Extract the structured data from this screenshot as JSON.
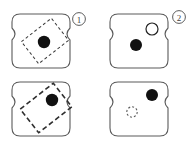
{
  "figure": {
    "title": "",
    "background_color": "#ffffff",
    "outline_color": "#555555",
    "filled_marker_color": "#111111",
    "hollow_marker_color": "#ffffff",
    "dashed_color": "#3a3a3a",
    "label_color": "#3f3f3f",
    "panel_count": 4,
    "group_count": 2
  },
  "groups": [
    {
      "id": "group-1",
      "label": "①",
      "number": "1"
    },
    {
      "id": "group-2",
      "label": "②",
      "number": "2"
    }
  ],
  "panels": [
    {
      "id": "panel-top-left",
      "position": "top-left",
      "group": "1",
      "shape": "spool-rounded-square",
      "markers": [
        {
          "kind": "filled-circle",
          "x": 44,
          "y": 42,
          "r": 6.2
        }
      ],
      "overlays": [
        {
          "kind": "dashed-rectangle",
          "cx": 45,
          "cy": 41,
          "width": 38,
          "height": 28,
          "rotation_deg": -38,
          "stroke_width": 1,
          "dash": "3 2.5"
        }
      ]
    },
    {
      "id": "panel-top-right",
      "position": "top-right",
      "group": "2",
      "shape": "spool-rounded-square",
      "markers": [
        {
          "kind": "filled-circle",
          "x": 136,
          "y": 45,
          "r": 6.0
        },
        {
          "kind": "hollow-circle",
          "x": 152,
          "y": 29,
          "r": 6.0
        }
      ],
      "overlays": []
    },
    {
      "id": "panel-bottom-left",
      "position": "bottom-left",
      "group": "1",
      "shape": "spool-rounded-square",
      "markers": [
        {
          "kind": "filled-circle",
          "x": 52,
          "y": 100,
          "r": 6.2
        }
      ],
      "overlays": [
        {
          "kind": "dashed-rectangle",
          "cx": 46,
          "cy": 108,
          "width": 42,
          "height": 30,
          "rotation_deg": -38,
          "stroke_width": 1.6,
          "dash": "5 3"
        }
      ]
    },
    {
      "id": "panel-bottom-right",
      "position": "bottom-right",
      "group": "2",
      "shape": "spool-rounded-square",
      "markers": [
        {
          "kind": "filled-circle",
          "x": 152,
          "y": 95,
          "r": 6.0
        },
        {
          "kind": "dashed-circle",
          "x": 132,
          "y": 112,
          "r": 5.2
        }
      ],
      "overlays": []
    }
  ],
  "annotations": {
    "group_1_label_x": 79,
    "group_1_label_y": 22,
    "group_2_label_x": 179,
    "group_2_label_y": 19
  }
}
